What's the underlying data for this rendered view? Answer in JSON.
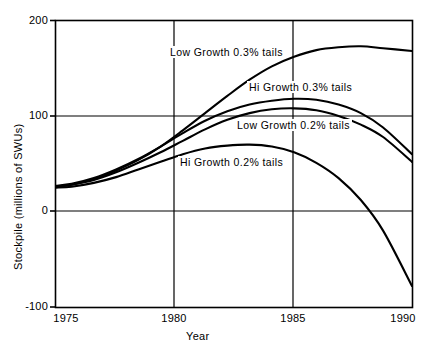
{
  "chart_data": {
    "type": "line",
    "title": "",
    "xlabel": "Year",
    "ylabel": "Stockpile (millions of SWUs)",
    "xlim": [
      1974.3,
      1990.3
    ],
    "ylim": [
      -100,
      200
    ],
    "xticks": [
      "1975",
      "1980",
      "1985",
      "1990"
    ],
    "xtick_values": [
      1975,
      1980,
      1985,
      1990
    ],
    "yticks": [
      "-100",
      "0",
      "100",
      "200"
    ],
    "ytick_values": [
      -100,
      0,
      100,
      200
    ],
    "grid": "gridlines at x=1980, x=1985 and y=0, y=100",
    "legend_position": "inline curve labels",
    "x": [
      1974.3,
      1975,
      1976,
      1977,
      1978,
      1979,
      1980,
      1981,
      1982,
      1983,
      1984,
      1985,
      1986,
      1987,
      1988,
      1989,
      1990.3
    ],
    "series": [
      {
        "name": "Low Growth 0.3% tails",
        "label": "Low Growth 0.3% tails",
        "values": [
          26,
          28,
          34,
          43,
          54,
          68,
          85,
          103,
          121,
          138,
          152,
          162,
          169,
          172,
          173,
          171,
          168
        ]
      },
      {
        "name": "Hi Growth 0.3% tails",
        "label": "Hi Growth 0.3% tails",
        "values": [
          27,
          29,
          35,
          44,
          55,
          68,
          82,
          95,
          105,
          112,
          116,
          118,
          117,
          112,
          103,
          88,
          60
        ]
      },
      {
        "name": "Low Growth 0.2% tails",
        "label": "Low Growth 0.2% tails",
        "values": [
          26,
          28,
          33,
          41,
          51,
          62,
          74,
          86,
          96,
          103,
          107,
          108,
          106,
          100,
          91,
          78,
          52
        ]
      },
      {
        "name": "Hi Growth 0.2% tails",
        "label": "Hi Growth 0.2% tails",
        "values": [
          25,
          26,
          30,
          36,
          44,
          52,
          60,
          66,
          69,
          70,
          68,
          62,
          51,
          35,
          12,
          -20,
          -78
        ]
      }
    ],
    "annotations": [
      {
        "text": "Low Growth 0.3% tails",
        "x_px": 168,
        "y_px": 53
      },
      {
        "text": "Hi Growth 0.3% tails",
        "x_px": 247,
        "y_px": 88
      },
      {
        "text": "Low Growth 0.2% tails",
        "x_px": 235,
        "y_px": 126
      },
      {
        "text": "Hi Growth 0.2% tails",
        "x_px": 178,
        "y_px": 163
      }
    ]
  }
}
